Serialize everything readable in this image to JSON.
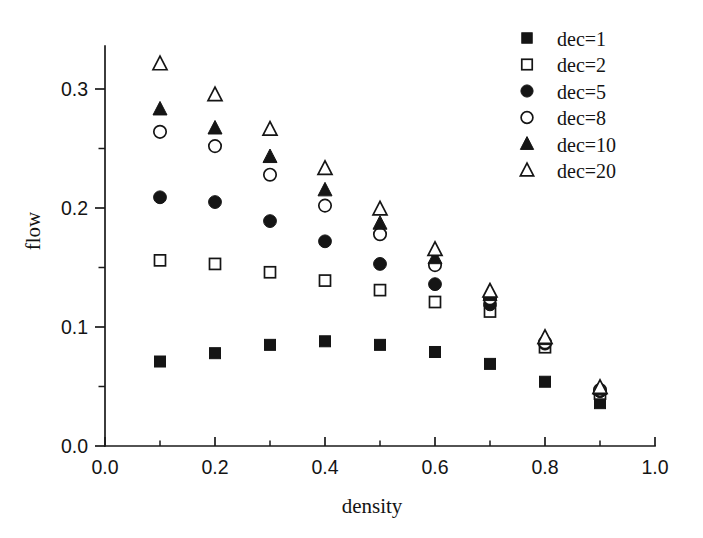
{
  "chart_data": {
    "type": "scatter",
    "title": "",
    "subtitle": "",
    "xlabel": "density",
    "ylabel": "flow",
    "xlim": [
      0.0,
      1.0
    ],
    "ylim": [
      0.0,
      0.335
    ],
    "x_ticks": [
      "0.0",
      "0.2",
      "0.4",
      "0.6",
      "0.8",
      "1.0"
    ],
    "x_tick_values": [
      0.0,
      0.2,
      0.4,
      0.6,
      0.8,
      1.0
    ],
    "x_minor_tick_values": [
      0.1,
      0.3,
      0.5,
      0.7,
      0.9
    ],
    "y_ticks": [
      "0.0",
      "0.1",
      "0.2",
      "0.3"
    ],
    "y_tick_values": [
      0.0,
      0.1,
      0.2,
      0.3
    ],
    "y_minor_tick_values": [
      0.05,
      0.15,
      0.25
    ],
    "grid": false,
    "legend_position": "top-right",
    "x": [
      0.1,
      0.2,
      0.3,
      0.4,
      0.5,
      0.6,
      0.7,
      0.8,
      0.9
    ],
    "series": [
      {
        "name": "dec=1",
        "marker": "filled-square",
        "color": "#151515",
        "values": [
          0.071,
          0.078,
          0.085,
          0.088,
          0.085,
          0.079,
          0.069,
          0.054,
          0.036
        ]
      },
      {
        "name": "dec=2",
        "marker": "open-square",
        "color": "#151515",
        "values": [
          0.156,
          0.153,
          0.146,
          0.139,
          0.131,
          0.121,
          0.113,
          0.083,
          0.044
        ]
      },
      {
        "name": "dec=5",
        "marker": "filled-circle",
        "color": "#151515",
        "values": [
          0.209,
          0.205,
          0.189,
          0.172,
          0.153,
          0.136,
          0.119,
          0.086,
          0.046
        ]
      },
      {
        "name": "dec=8",
        "marker": "open-circle",
        "color": "#151515",
        "values": [
          0.264,
          0.252,
          0.228,
          0.202,
          0.178,
          0.152,
          0.124,
          0.087,
          0.047
        ]
      },
      {
        "name": "dec=10",
        "marker": "filled-triangle",
        "color": "#151515",
        "values": [
          0.283,
          0.267,
          0.243,
          0.215,
          0.187,
          0.158,
          0.127,
          0.09,
          0.048
        ]
      },
      {
        "name": "dec=20",
        "marker": "open-triangle",
        "color": "#151515",
        "values": [
          0.321,
          0.295,
          0.266,
          0.233,
          0.199,
          0.165,
          0.13,
          0.091,
          0.049
        ]
      }
    ]
  },
  "legend": {
    "entries": [
      {
        "label": "dec=1",
        "marker": "filled-square"
      },
      {
        "label": "dec=2",
        "marker": "open-square"
      },
      {
        "label": "dec=5",
        "marker": "filled-circle"
      },
      {
        "label": "dec=8",
        "marker": "open-circle"
      },
      {
        "label": "dec=10",
        "marker": "filled-triangle"
      },
      {
        "label": "dec=20",
        "marker": "open-triangle"
      }
    ]
  },
  "axes": {
    "x_title": "density",
    "y_title": "flow"
  },
  "colors": {
    "ink": "#151515",
    "background": "#ffffff"
  }
}
